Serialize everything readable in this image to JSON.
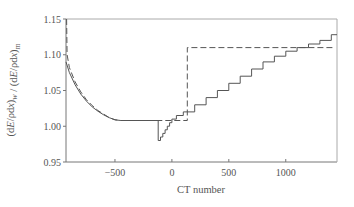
{
  "chart_data": {
    "type": "line",
    "title": "",
    "xlabel": "CT number",
    "ylabel": "(dE/ρdx)_w / (dE/ρdx)_m",
    "xlim": [
      -930,
      1450
    ],
    "ylim": [
      0.95,
      1.15
    ],
    "x_ticks": [
      -500,
      0,
      500,
      1000
    ],
    "x_tick_labels": [
      "−500",
      "0",
      "500",
      "1000"
    ],
    "y_ticks": [
      0.95,
      1.0,
      1.05,
      1.1,
      1.15
    ],
    "y_tick_labels": [
      "0.95",
      "1.00",
      "1.05",
      "1.10",
      "1.15"
    ],
    "grid": false,
    "legend": null,
    "series": [
      {
        "name": "solid",
        "style": "solid",
        "color": "#555555",
        "points": [
          [
            -930,
            1.09
          ],
          [
            -900,
            1.075
          ],
          [
            -850,
            1.058
          ],
          [
            -800,
            1.045
          ],
          [
            -750,
            1.035
          ],
          [
            -700,
            1.027
          ],
          [
            -650,
            1.021
          ],
          [
            -600,
            1.016
          ],
          [
            -550,
            1.012
          ],
          [
            -500,
            1.009
          ],
          [
            -450,
            1.008
          ],
          [
            -120,
            1.008
          ],
          [
            -120,
            0.98
          ],
          [
            -100,
            0.98
          ],
          [
            -100,
            0.985
          ],
          [
            -80,
            0.985
          ],
          [
            -80,
            0.99
          ],
          [
            -60,
            0.99
          ],
          [
            -60,
            0.995
          ],
          [
            -40,
            0.995
          ],
          [
            -40,
            1.0
          ],
          [
            -20,
            1.0
          ],
          [
            -20,
            1.005
          ],
          [
            0,
            1.005
          ],
          [
            0,
            1.01
          ],
          [
            40,
            1.01
          ],
          [
            40,
            1.015
          ],
          [
            100,
            1.015
          ],
          [
            100,
            1.02
          ],
          [
            200,
            1.02
          ],
          [
            200,
            1.03
          ],
          [
            300,
            1.03
          ],
          [
            300,
            1.04
          ],
          [
            400,
            1.04
          ],
          [
            400,
            1.05
          ],
          [
            500,
            1.05
          ],
          [
            500,
            1.06
          ],
          [
            600,
            1.06
          ],
          [
            600,
            1.07
          ],
          [
            700,
            1.07
          ],
          [
            700,
            1.08
          ],
          [
            800,
            1.08
          ],
          [
            800,
            1.09
          ],
          [
            900,
            1.09
          ],
          [
            900,
            1.098
          ],
          [
            1000,
            1.098
          ],
          [
            1000,
            1.105
          ],
          [
            1100,
            1.105
          ],
          [
            1100,
            1.11
          ],
          [
            1200,
            1.11
          ],
          [
            1200,
            1.115
          ],
          [
            1300,
            1.115
          ],
          [
            1300,
            1.12
          ],
          [
            1400,
            1.12
          ],
          [
            1400,
            1.128
          ],
          [
            1450,
            1.128
          ]
        ]
      },
      {
        "name": "dashed",
        "style": "dashed",
        "color": "#555555",
        "points": [
          [
            -925,
            1.15
          ],
          [
            -920,
            1.1
          ],
          [
            -900,
            1.082
          ],
          [
            -850,
            1.062
          ],
          [
            -800,
            1.048
          ],
          [
            -750,
            1.037
          ],
          [
            -700,
            1.029
          ],
          [
            -650,
            1.022
          ],
          [
            -600,
            1.017
          ],
          [
            -550,
            1.012
          ],
          [
            -500,
            1.009
          ],
          [
            -450,
            1.008
          ],
          [
            135,
            1.008
          ],
          [
            135,
            1.11
          ],
          [
            1430,
            1.11
          ]
        ]
      }
    ]
  }
}
